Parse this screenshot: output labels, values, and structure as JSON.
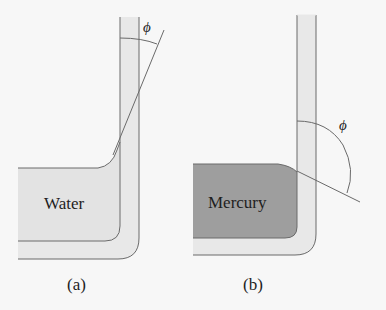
{
  "figure": {
    "panels": [
      {
        "id": "a",
        "caption": "(a)",
        "liquid_label": "Water",
        "angle_label": "ϕ",
        "liquid_color": "#e3e3e3",
        "description": "Water wets the glass; meniscus curves upward; small contact angle"
      },
      {
        "id": "b",
        "caption": "(b)",
        "liquid_label": "Mercury",
        "angle_label": "ϕ",
        "liquid_color": "#9e9e9e",
        "description": "Mercury does not wet the glass; convex meniscus; obtuse contact angle"
      }
    ],
    "colors": {
      "background": "#f7f7f7",
      "glass_fill": "#e8e8e8",
      "stroke": "#6a6a6a",
      "text": "#1e1e1e"
    }
  }
}
